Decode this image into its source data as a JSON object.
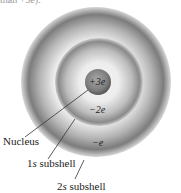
{
  "cropped_header_text": "than +3e).",
  "diagram": {
    "nucleus": {
      "charge": "+3e",
      "label": "Nucleus"
    },
    "shells": [
      {
        "name": "1s",
        "label_letter": "1",
        "label_suffix": "s",
        "label_rest": " subshell",
        "charge": "−2e"
      },
      {
        "name": "2s",
        "label_letter": "2",
        "label_suffix": "s",
        "label_rest": " subshell",
        "charge": "−e"
      }
    ],
    "colors": {
      "shell_dark": "#6e6e6e",
      "shell_light": "#e6e6e6",
      "nucleus": "#7a7a7a",
      "leader": "#333333"
    }
  }
}
